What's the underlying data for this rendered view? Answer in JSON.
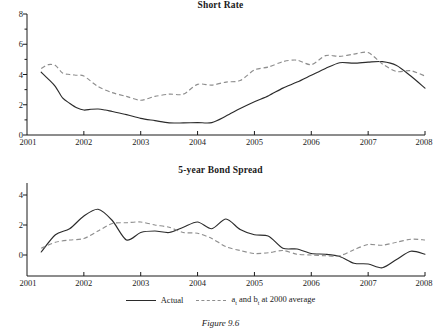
{
  "figure": {
    "caption": "Figure 9.6"
  },
  "legend": {
    "position": "bottom-center",
    "items": [
      {
        "label": "Actual",
        "style": "solid",
        "color": "#2b2b2b"
      },
      {
        "label_prefix": "a",
        "label_sub1": "t",
        "label_mid": " and b",
        "label_sub2": "t",
        "label_suffix": " at 2000 average",
        "label_plain": "a_t and b_t at 2000 average",
        "style": "dashed",
        "color": "#8e8e8e"
      }
    ]
  },
  "chart_data": [
    {
      "type": "line",
      "title": "Short Rate",
      "xlabel": "",
      "ylabel": "",
      "xlim": [
        2001,
        2008
      ],
      "ylim": [
        0,
        8
      ],
      "yticks": [
        0,
        2,
        4,
        6,
        8
      ],
      "yticks_minor": [
        1,
        3,
        5,
        7
      ],
      "xticks": [
        2001,
        2002,
        2003,
        2004,
        2005,
        2006,
        2007,
        2008
      ],
      "grid": false,
      "series": [
        {
          "name": "Actual",
          "style": "solid",
          "color": "#2b2b2b",
          "x": [
            2001.25,
            2001.375,
            2001.5,
            2001.625,
            2001.75,
            2001.875,
            2002.0,
            2002.125,
            2002.25,
            2002.375,
            2002.5,
            2002.75,
            2003.0,
            2003.25,
            2003.5,
            2003.75,
            2004.0,
            2004.25,
            2004.5,
            2004.75,
            2005.0,
            2005.25,
            2005.5,
            2005.75,
            2006.0,
            2006.25,
            2006.5,
            2006.75,
            2007.0,
            2007.25,
            2007.5,
            2007.75,
            2008.0
          ],
          "y": [
            4.15,
            3.7,
            3.2,
            2.45,
            2.1,
            1.8,
            1.65,
            1.7,
            1.72,
            1.65,
            1.55,
            1.35,
            1.1,
            0.95,
            0.8,
            0.8,
            0.82,
            0.82,
            1.25,
            1.75,
            2.2,
            2.6,
            3.1,
            3.5,
            3.95,
            4.4,
            4.78,
            4.75,
            4.82,
            4.85,
            4.6,
            3.9,
            3.1
          ]
        },
        {
          "name": "a_t and b_t at 2000 average",
          "style": "dashed",
          "color": "#8e8e8e",
          "x": [
            2001.25,
            2001.375,
            2001.5,
            2001.625,
            2001.75,
            2001.875,
            2002.0,
            2002.25,
            2002.5,
            2002.75,
            2003.0,
            2003.25,
            2003.5,
            2003.75,
            2004.0,
            2004.25,
            2004.5,
            2004.75,
            2005.0,
            2005.25,
            2005.5,
            2005.75,
            2006.0,
            2006.25,
            2006.5,
            2006.75,
            2007.0,
            2007.25,
            2007.5,
            2007.75,
            2008.0
          ],
          "y": [
            4.4,
            4.65,
            4.6,
            4.1,
            4.0,
            3.95,
            3.9,
            3.2,
            2.8,
            2.55,
            2.3,
            2.55,
            2.7,
            2.7,
            3.35,
            3.3,
            3.5,
            3.6,
            4.3,
            4.5,
            4.85,
            4.95,
            4.65,
            5.25,
            5.2,
            5.35,
            5.45,
            4.7,
            4.2,
            4.25,
            3.9
          ]
        }
      ]
    },
    {
      "type": "line",
      "title": "5-year Bond Spread",
      "xlabel": "",
      "ylabel": "",
      "xlim": [
        2001,
        2008
      ],
      "ylim": [
        -1.4,
        4.8
      ],
      "yticks": [
        0,
        2,
        4
      ],
      "xticks": [
        2001,
        2002,
        2003,
        2004,
        2005,
        2006,
        2007,
        2008
      ],
      "grid": false,
      "series": [
        {
          "name": "Actual",
          "style": "solid",
          "color": "#2b2b2b",
          "x": [
            2001.25,
            2001.5,
            2001.75,
            2002.0,
            2002.25,
            2002.5,
            2002.75,
            2003.0,
            2003.25,
            2003.5,
            2003.75,
            2004.0,
            2004.25,
            2004.5,
            2004.75,
            2005.0,
            2005.25,
            2005.5,
            2005.75,
            2006.0,
            2006.25,
            2006.5,
            2006.75,
            2007.0,
            2007.25,
            2007.5,
            2007.75,
            2008.0
          ],
          "y": [
            0.2,
            1.35,
            1.75,
            2.6,
            3.05,
            2.3,
            1.0,
            1.5,
            1.6,
            1.5,
            1.85,
            2.2,
            1.75,
            2.4,
            1.7,
            1.35,
            1.25,
            0.45,
            0.4,
            0.1,
            0.05,
            -0.1,
            -0.55,
            -0.6,
            -0.85,
            -0.3,
            0.25,
            0.05
          ]
        },
        {
          "name": "a_t and b_t at 2000 average",
          "style": "dashed",
          "color": "#8e8e8e",
          "x": [
            2001.25,
            2001.5,
            2001.75,
            2002.0,
            2002.25,
            2002.5,
            2002.75,
            2003.0,
            2003.25,
            2003.5,
            2003.75,
            2004.0,
            2004.25,
            2004.5,
            2004.75,
            2005.0,
            2005.25,
            2005.5,
            2005.75,
            2006.0,
            2006.25,
            2006.5,
            2006.75,
            2007.0,
            2007.25,
            2007.5,
            2007.75,
            2008.0
          ],
          "y": [
            0.45,
            0.85,
            1.0,
            1.1,
            1.6,
            2.1,
            2.15,
            2.2,
            2.0,
            1.85,
            1.5,
            1.45,
            1.1,
            0.55,
            0.3,
            0.1,
            0.15,
            0.3,
            0.05,
            0.0,
            -0.05,
            -0.05,
            0.35,
            0.7,
            0.65,
            0.85,
            1.05,
            1.0
          ]
        }
      ]
    }
  ]
}
